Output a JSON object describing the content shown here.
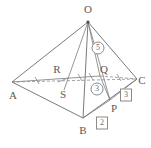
{
  "figure": {
    "name": "pyramid-oabc-diagram",
    "colors": {
      "stroke": "#6b6b6b",
      "dashed_stroke": "#8a8a8a",
      "label_text": "#5a5a5a",
      "annotation_text": "#6a6a6a",
      "annotation_border": "#8a8a8a",
      "background": "#ffffff"
    },
    "vertices": [
      {
        "id": "O",
        "label": "O",
        "point_x": 88,
        "point_y": 22,
        "label_x": 88,
        "label_y": 9
      },
      {
        "id": "A",
        "label": "A",
        "point_x": 12,
        "point_y": 82,
        "label_x": 13,
        "label_y": 95
      },
      {
        "id": "B",
        "label": "B",
        "point_x": 83,
        "point_y": 118,
        "label_x": 83,
        "label_y": 130
      },
      {
        "id": "C",
        "label": "C",
        "point_x": 137,
        "point_y": 79,
        "label_x": 142,
        "label_y": 80
      },
      {
        "id": "P",
        "label": "P",
        "point_x": 110,
        "point_y": 100,
        "label_x": 114,
        "label_y": 108
      },
      {
        "id": "Q",
        "label": "Q",
        "point_x": 100,
        "point_y": 76,
        "label_x": 104,
        "label_y": 69
      },
      {
        "id": "R",
        "label": "R",
        "point_x": 60,
        "point_y": 77,
        "label_x": 57,
        "label_y": 69
      },
      {
        "id": "S",
        "label": "S",
        "point_x": 64,
        "point_y": 85,
        "label_x": 63,
        "label_y": 94
      }
    ],
    "edges": [
      {
        "id": "OA",
        "from": "O",
        "to": "A",
        "style": "solid"
      },
      {
        "id": "OB",
        "from": "O",
        "to": "B",
        "style": "solid"
      },
      {
        "id": "OC",
        "from": "O",
        "to": "C",
        "style": "solid"
      },
      {
        "id": "AB",
        "from": "A",
        "to": "B",
        "style": "solid"
      },
      {
        "id": "BC",
        "from": "B",
        "to": "C",
        "style": "solid"
      },
      {
        "id": "AC",
        "from": "A",
        "to": "C",
        "style": "dashed"
      },
      {
        "id": "OP",
        "from": "O",
        "to": "P",
        "style": "solid"
      },
      {
        "id": "OQ",
        "from": "O",
        "to": "Q",
        "style": "solid"
      },
      {
        "id": "OS",
        "from": "O",
        "to": "S",
        "style": "solid"
      },
      {
        "id": "AQ",
        "from": "A",
        "to": "Q",
        "style": "solid"
      },
      {
        "id": "QP",
        "from": "Q",
        "to": "P",
        "style": "solid"
      },
      {
        "id": "QC",
        "from": "Q",
        "to": "C",
        "style": "dashed"
      },
      {
        "id": "BP",
        "from": "B",
        "to": "P",
        "style": "solid"
      },
      {
        "id": "PC",
        "from": "P",
        "to": "C",
        "style": "solid"
      }
    ],
    "annotations": [
      {
        "id": "circled-5",
        "text": "5",
        "shape": "circle",
        "x": 98,
        "y": 48
      },
      {
        "id": "circled-3",
        "text": "3",
        "shape": "circle",
        "x": 97,
        "y": 89
      },
      {
        "id": "boxed-3",
        "text": "3",
        "shape": "box",
        "x": 126,
        "y": 95
      },
      {
        "id": "boxed-2",
        "text": "2",
        "shape": "box",
        "x": 102,
        "y": 123
      }
    ]
  }
}
